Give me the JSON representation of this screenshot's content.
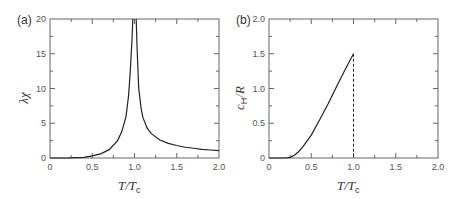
{
  "chart_data": [
    {
      "panel": "(a)",
      "type": "line",
      "title": "",
      "xlabel": "T/T_c",
      "ylabel": "λχ",
      "xlim": [
        0,
        2.0
      ],
      "ylim": [
        0,
        20
      ],
      "xticks": [
        "0",
        "0.5",
        "1.0",
        "1.5",
        "2.0"
      ],
      "yticks": [
        "0",
        "5",
        "10",
        "15",
        "20"
      ],
      "grid": false,
      "legend": null,
      "series": [
        {
          "name": "susceptibility",
          "style": "solid",
          "x": [
            0.0,
            0.2,
            0.3,
            0.4,
            0.5,
            0.6,
            0.7,
            0.8,
            0.85,
            0.9,
            0.93,
            0.95,
            0.97,
            0.98,
            1.02,
            1.03,
            1.05,
            1.08,
            1.1,
            1.15,
            1.2,
            1.3,
            1.4,
            1.5,
            1.6,
            1.7,
            1.8,
            1.9,
            2.0
          ],
          "y": [
            0.0,
            0.0,
            0.05,
            0.1,
            0.3,
            0.6,
            1.2,
            2.5,
            3.8,
            6.0,
            9.0,
            12.5,
            17.0,
            20.0,
            20.0,
            16.0,
            10.0,
            7.0,
            5.8,
            4.3,
            3.5,
            2.6,
            2.1,
            1.8,
            1.55,
            1.4,
            1.25,
            1.15,
            1.05
          ]
        }
      ]
    },
    {
      "panel": "(b)",
      "type": "line",
      "title": "",
      "xlabel": "T/T_c",
      "ylabel": "c_H/R",
      "xlim": [
        0,
        2.0
      ],
      "ylim": [
        0,
        2.0
      ],
      "xticks": [
        "0",
        "0.5",
        "1.0",
        "1.5",
        "2.0"
      ],
      "yticks": [
        "0",
        "0.5",
        "1.0",
        "1.5",
        "2.0"
      ],
      "grid": false,
      "legend": null,
      "series": [
        {
          "name": "specific heat",
          "style": "solid",
          "x": [
            0.0,
            0.2,
            0.25,
            0.3,
            0.35,
            0.4,
            0.5,
            0.6,
            0.7,
            0.8,
            0.9,
            1.0
          ],
          "y": [
            0.0,
            0.0,
            0.01,
            0.04,
            0.09,
            0.16,
            0.33,
            0.55,
            0.78,
            1.03,
            1.27,
            1.5
          ]
        },
        {
          "name": "discontinuity at Tc",
          "style": "dashed",
          "x": [
            1.0,
            1.0
          ],
          "y": [
            1.5,
            0.0
          ]
        }
      ],
      "annotations": [
        "dashed vertical line at T/Tc = 1.0"
      ]
    }
  ],
  "panels": [
    {
      "label": "(a)",
      "ylabel_main": "λχ",
      "xlabel_main": "T/T",
      "xlabel_sub": "c",
      "xticks": [
        "0",
        "0.5",
        "1.0",
        "1.5",
        "2.0"
      ],
      "yticks": [
        "0",
        "5",
        "10",
        "15",
        "20"
      ]
    },
    {
      "label": "(b)",
      "ylabel_main": "c",
      "ylabel_sub": "H",
      "ylabel_tail": "/R",
      "xlabel_main": "T/T",
      "xlabel_sub": "c",
      "xticks": [
        "0",
        "0.5",
        "1.0",
        "1.5",
        "2.0"
      ],
      "yticks": [
        "0",
        "0.5",
        "1.0",
        "1.5",
        "2.0"
      ]
    }
  ],
  "colors": {
    "axis": "#555555",
    "line": "#222222",
    "text": "#444444"
  }
}
